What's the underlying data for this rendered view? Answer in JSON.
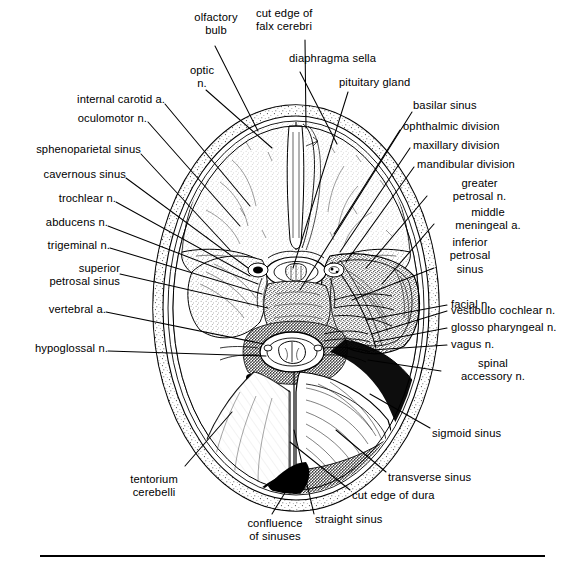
{
  "figure": {
    "stroke_color": "#000000",
    "fill_color": "#ffffff",
    "background": "#ffffff",
    "rule": {
      "present": true,
      "x1": 40,
      "x2": 545,
      "y": 556,
      "thickness": 2
    }
  },
  "labels": {
    "olfactory_bulb": "olfactory\nbulb",
    "cut_edge_falx": "cut edge of\nfalx cerebri",
    "optic_n": "optic\nn.",
    "diaphragma_sella": "diaphragma sella",
    "pituitary_gland": "pituitary gland",
    "internal_carotid_a": "internal carotid a.",
    "basilar_sinus": "basilar sinus",
    "oculomotor_n": "oculomotor n.",
    "ophthalmic_division": "ophthalmic division",
    "sphenoparietal_sinus": "sphenoparietal sinus",
    "maxillary_division": "maxillary division",
    "mandibular_division": "mandibular division",
    "cavernous_sinus": "cavernous sinus",
    "greater_petrosal_n": "greater\npetrosal n.",
    "trochlear_n": "trochlear n.",
    "middle_meningeal_a": "middle\nmeningeal a.",
    "abducens_n": "abducens n.",
    "inferior_petrosal_sinus": "inferior\npetrosal\nsinus",
    "trigeminal_n": "trigeminal n.",
    "superior_petrosal_sinus": "superior\npetrosal sinus",
    "facial_n": "facial n.",
    "vestibulo_cochlear_n": "vestibulo cochlear n.",
    "vertebral_a": "vertebral a.",
    "glosso_pharyngeal_n": "glosso pharyngeal n.",
    "vagus_n": "vagus n.",
    "hypoglossal_n": "hypoglossal n.",
    "spinal_accessory_n": "spinal\naccessory n.",
    "sigmoid_sinus": "sigmoid sinus",
    "tentorium_cerebelli": "tentorium\ncerebelli",
    "transverse_sinus": "transverse sinus",
    "cut_edge_of_dura": "cut edge of dura",
    "confluence_of_sinuses": "confluence\nof sinuses",
    "straight_sinus": "straight sinus"
  }
}
